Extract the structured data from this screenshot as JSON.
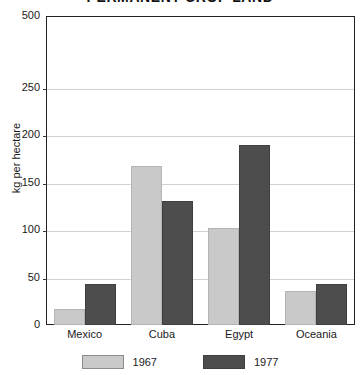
{
  "chart_data": {
    "type": "bar",
    "title": "PERMANENT CROP LAND",
    "xlabel": "",
    "ylabel": "kg per hectare",
    "categories": [
      "Mexico",
      "Cuba",
      "Egypt",
      "Oceania"
    ],
    "series": [
      {
        "name": "1967",
        "values": [
          17,
          168,
          102,
          36
        ],
        "color": "#c9c9c9"
      },
      {
        "name": "1977",
        "values": [
          43,
          131,
          190,
          43
        ],
        "color": "#4d4d4d"
      }
    ],
    "ylim": [
      0,
      500
    ],
    "y_ticks": [
      {
        "label": "0",
        "value": 0
      },
      {
        "label": "50",
        "value": 50
      },
      {
        "label": "100",
        "value": 100
      },
      {
        "label": "150",
        "value": 150
      },
      {
        "label": "200",
        "value": 200
      },
      {
        "label": "250",
        "value": 250
      },
      {
        "label": "500",
        "value": 500
      }
    ],
    "y_axis_note": "broken scale: 0-250 linear, 250-500 compressed",
    "grid": true,
    "legend_position": "bottom"
  }
}
